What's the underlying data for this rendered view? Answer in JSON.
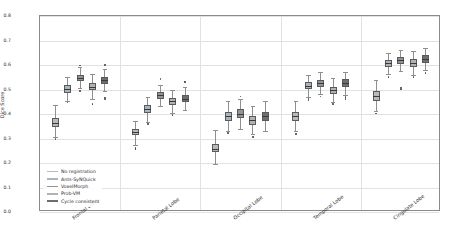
{
  "chart_data": {
    "type": "box",
    "title": "",
    "xlabel": "",
    "ylabel": "Dice Score",
    "ylim": [
      0.0,
      0.8
    ],
    "yticks": [
      "0.0",
      "0.1",
      "0.2",
      "0.3",
      "0.4",
      "0.5",
      "0.6",
      "0.7",
      "0.8"
    ],
    "grid": true,
    "legend_position": "lower left",
    "categories": [
      "Frontal Lobe",
      "Parietal Lobe",
      "Occipital Lobe",
      "Temporal Lobe",
      "Cingulate Lobe"
    ],
    "series": [
      {
        "name": "No registration",
        "color": "#b9b9b9",
        "boxes": [
          {
            "category": "Frontal Lobe",
            "q1": 0.345,
            "median": 0.363,
            "q3": 0.383,
            "whisker_low": 0.305,
            "whisker_high": 0.437,
            "fliers": [
              0.298
            ]
          },
          {
            "category": "Parietal Lobe",
            "q1": 0.313,
            "median": 0.325,
            "q3": 0.338,
            "whisker_low": 0.272,
            "whisker_high": 0.372,
            "fliers": [
              0.262,
              0.258
            ]
          },
          {
            "category": "Occipital Lobe",
            "q1": 0.243,
            "median": 0.259,
            "q3": 0.276,
            "whisker_low": 0.196,
            "whisker_high": 0.333,
            "fliers": []
          },
          {
            "category": "Temporal Lobe",
            "q1": 0.372,
            "median": 0.39,
            "q3": 0.407,
            "whisker_low": 0.33,
            "whisker_high": 0.452,
            "fliers": [
              0.318
            ]
          },
          {
            "category": "Cingulate Lobe",
            "q1": 0.455,
            "median": 0.474,
            "q3": 0.492,
            "whisker_low": 0.412,
            "whisker_high": 0.537,
            "fliers": [
              0.402
            ]
          }
        ]
      },
      {
        "name": "Ants-SyNQuick",
        "color": "#a9b4bd",
        "boxes": [
          {
            "category": "Frontal Lobe",
            "q1": 0.487,
            "median": 0.502,
            "q3": 0.517,
            "whisker_low": 0.455,
            "whisker_high": 0.552,
            "fliers": [
              0.447
            ]
          },
          {
            "category": "Parietal Lobe",
            "q1": 0.405,
            "median": 0.421,
            "q3": 0.437,
            "whisker_low": 0.368,
            "whisker_high": 0.47,
            "fliers": [
              0.358
            ]
          },
          {
            "category": "Occipital Lobe",
            "q1": 0.372,
            "median": 0.391,
            "q3": 0.41,
            "whisker_low": 0.33,
            "whisker_high": 0.452,
            "fliers": [
              0.322
            ]
          },
          {
            "category": "Temporal Lobe",
            "q1": 0.501,
            "median": 0.515,
            "q3": 0.529,
            "whisker_low": 0.47,
            "whisker_high": 0.56,
            "fliers": [
              0.462,
              0.455
            ]
          },
          {
            "category": "Cingulate Lobe",
            "q1": 0.592,
            "median": 0.607,
            "q3": 0.621,
            "whisker_low": 0.562,
            "whisker_high": 0.65,
            "fliers": [
              0.552
            ]
          }
        ]
      },
      {
        "name": "VoxelMorph",
        "color": "#8f9499",
        "boxes": [
          {
            "category": "Frontal Lobe",
            "q1": 0.533,
            "median": 0.546,
            "q3": 0.559,
            "whisker_low": 0.505,
            "whisker_high": 0.59,
            "fliers": [
              0.495,
              0.598
            ]
          },
          {
            "category": "Parietal Lobe",
            "q1": 0.462,
            "median": 0.476,
            "q3": 0.49,
            "whisker_low": 0.432,
            "whisker_high": 0.52,
            "fliers": [
              0.54,
              0.545
            ]
          },
          {
            "category": "Occipital Lobe",
            "q1": 0.382,
            "median": 0.401,
            "q3": 0.42,
            "whisker_low": 0.34,
            "whisker_high": 0.462,
            "fliers": [
              0.472
            ]
          },
          {
            "category": "Temporal Lobe",
            "q1": 0.512,
            "median": 0.526,
            "q3": 0.54,
            "whisker_low": 0.481,
            "whisker_high": 0.571,
            "fliers": [
              0.471
            ]
          },
          {
            "category": "Cingulate Lobe",
            "q1": 0.605,
            "median": 0.619,
            "q3": 0.633,
            "whisker_low": 0.575,
            "whisker_high": 0.662,
            "fliers": [
              0.505,
              0.5
            ]
          }
        ]
      },
      {
        "name": "Prob-VM",
        "color": "#b2b2b2",
        "boxes": [
          {
            "category": "Frontal Lobe",
            "q1": 0.496,
            "median": 0.512,
            "q3": 0.528,
            "whisker_low": 0.462,
            "whisker_high": 0.562,
            "fliers": [
              0.441
            ]
          },
          {
            "category": "Parietal Lobe",
            "q1": 0.437,
            "median": 0.452,
            "q3": 0.467,
            "whisker_low": 0.405,
            "whisker_high": 0.499,
            "fliers": [
              0.395
            ]
          },
          {
            "category": "Occipital Lobe",
            "q1": 0.357,
            "median": 0.375,
            "q3": 0.393,
            "whisker_low": 0.317,
            "whisker_high": 0.433,
            "fliers": [
              0.307
            ]
          },
          {
            "category": "Temporal Lobe",
            "q1": 0.482,
            "median": 0.497,
            "q3": 0.512,
            "whisker_low": 0.45,
            "whisker_high": 0.545,
            "fliers": [
              0.44
            ]
          },
          {
            "category": "Cingulate Lobe",
            "q1": 0.592,
            "median": 0.608,
            "q3": 0.624,
            "whisker_low": 0.56,
            "whisker_high": 0.656,
            "fliers": [
              0.55
            ]
          }
        ]
      },
      {
        "name": "Cycle consistent",
        "color": "#6e6e6e",
        "boxes": [
          {
            "category": "Frontal Lobe",
            "q1": 0.523,
            "median": 0.537,
            "q3": 0.551,
            "whisker_low": 0.492,
            "whisker_high": 0.582,
            "fliers": [
              0.468,
              0.462,
              0.6
            ]
          },
          {
            "category": "Parietal Lobe",
            "q1": 0.447,
            "median": 0.462,
            "q3": 0.477,
            "whisker_low": 0.415,
            "whisker_high": 0.51,
            "fliers": [
              0.528,
              0.533
            ]
          },
          {
            "category": "Occipital Lobe",
            "q1": 0.372,
            "median": 0.391,
            "q3": 0.41,
            "whisker_low": 0.33,
            "whisker_high": 0.455,
            "fliers": []
          },
          {
            "category": "Temporal Lobe",
            "q1": 0.511,
            "median": 0.526,
            "q3": 0.541,
            "whisker_low": 0.479,
            "whisker_high": 0.573,
            "fliers": [
              0.469,
              0.462
            ]
          },
          {
            "category": "Cingulate Lobe",
            "q1": 0.61,
            "median": 0.625,
            "q3": 0.64,
            "whisker_low": 0.578,
            "whisker_high": 0.67,
            "fliers": [
              0.568
            ]
          }
        ]
      }
    ]
  },
  "legend": {
    "items": [
      {
        "label": "No registration"
      },
      {
        "label": "Ants-SyNQuick"
      },
      {
        "label": "VoxelMorph"
      },
      {
        "label": "Prob-VM"
      },
      {
        "label": "Cycle consistent"
      }
    ]
  }
}
